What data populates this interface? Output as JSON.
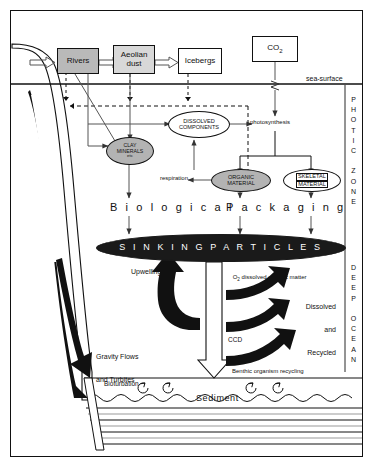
{
  "figure": {
    "zones": {
      "upper_label": "PHOTIC ZONE",
      "lower_label": "DEEP OCEAN",
      "sea_surface_label": "sea-surface"
    }
  },
  "sources": {
    "rivers": "Rivers",
    "aeolian_dust_line1": "Aeolian",
    "aeolian_dust_line2": "dust",
    "icebergs": "Icebergs",
    "co2": "CO",
    "co2_sub": "2"
  },
  "pools": {
    "dissolved_line1": "DISSOLVED",
    "dissolved_line2": "COMPONENTS",
    "clay_line1": "CLAY",
    "clay_line2": "MINERALS",
    "clay_line3": "etc",
    "organic_line1": "ORGANIC",
    "organic_line2": "MATERIAL",
    "skeletal_line1": "SKELETAL",
    "skeletal_line2": "MATERIAL",
    "sinking_particles": "S I N K I N G    P A R T I C L E S"
  },
  "processes": {
    "photosynthesis": "photosynthesis",
    "respiration": "respiration",
    "biological": "B i o l o g i c a l",
    "packaging": "P a c k a g i n g",
    "upwelling": "Upwelling",
    "o2_dissolved": "O",
    "o2_sub": "2",
    "o2_rest": " dissolved organic matter",
    "dissolved_recycled_1": "Dissolved",
    "dissolved_recycled_2": "and",
    "dissolved_recycled_3": "Recycled",
    "ccd": "CCD",
    "gravity_1": "Gravity Flows",
    "gravity_2": "and Turbites",
    "benthic": "Benthic organism recycling",
    "bioturbation": "Bioturbation",
    "sediment": "Sediment"
  },
  "colors": {
    "outline": "#111111",
    "grey_fill": "#b9b9b9",
    "light_grey_fill": "#d8d8d8",
    "pool_grey": "#b3b3b3",
    "black_fill": "#1a1a1a",
    "white_fill": "#ffffff"
  }
}
